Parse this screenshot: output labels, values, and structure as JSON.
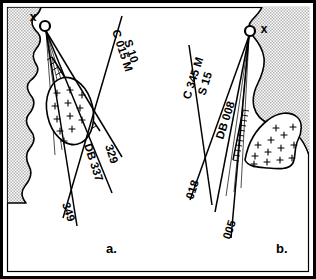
{
  "figure": {
    "type": "geological-survey-map-pair",
    "panels": [
      {
        "id": "a",
        "caption": "a.",
        "station_marker": "x",
        "lines": [
          {
            "label": "C 015 M",
            "name": "line-c015m"
          },
          {
            "label": "S 10",
            "name": "line-s10"
          },
          {
            "label": "329",
            "name": "line-329"
          },
          {
            "label": "DB 337",
            "name": "line-db337"
          },
          {
            "label": "349",
            "name": "line-349"
          }
        ]
      },
      {
        "id": "b",
        "caption": "b.",
        "station_marker": "x",
        "lines": [
          {
            "label": "C 345 M",
            "name": "line-c345m"
          },
          {
            "label": "S 15",
            "name": "line-s15"
          },
          {
            "label": "DB 008",
            "name": "line-db008"
          },
          {
            "label": "018",
            "name": "line-018"
          },
          {
            "label": "005",
            "name": "line-005"
          }
        ]
      }
    ],
    "legend_symbols": {
      "stipple": "land / shaded terrain",
      "plus_fill": "intrusive body",
      "hachure": "fault scarp with tick marks",
      "circle": "survey station node",
      "x": "reference point marker"
    },
    "colors": {
      "ink": "#000000",
      "paper": "#ffffff",
      "stipple": "#c8c8c8",
      "frame": "#000000"
    }
  }
}
